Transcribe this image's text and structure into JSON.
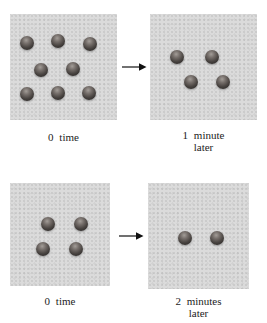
{
  "colors": {
    "background": "#ffffff",
    "box_background": "#dbdbdb",
    "sphere_highlight": "#a39d98",
    "sphere_dark": "#262322",
    "label_text": "#1c1c1c",
    "arrow": "#111111"
  },
  "panels": [
    {
      "name": "top-left",
      "label_lines": [
        "0 time"
      ],
      "sphere_count": 8,
      "spheres": [
        {
          "x": 10,
          "y": 22
        },
        {
          "x": 41,
          "y": 20
        },
        {
          "x": 73,
          "y": 23
        },
        {
          "x": 24,
          "y": 49
        },
        {
          "x": 56,
          "y": 48
        },
        {
          "x": 10,
          "y": 73
        },
        {
          "x": 41,
          "y": 72
        },
        {
          "x": 72,
          "y": 72
        }
      ]
    },
    {
      "name": "top-right",
      "label_lines": [
        "1 minute",
        "later"
      ],
      "sphere_count": 4,
      "spheres": [
        {
          "x": 20,
          "y": 36
        },
        {
          "x": 55,
          "y": 36
        },
        {
          "x": 34,
          "y": 61
        },
        {
          "x": 66,
          "y": 61
        }
      ]
    },
    {
      "name": "bottom-left",
      "label_lines": [
        "0 time"
      ],
      "sphere_count": 4,
      "spheres": [
        {
          "x": 31,
          "y": 34
        },
        {
          "x": 64,
          "y": 34
        },
        {
          "x": 26,
          "y": 59
        },
        {
          "x": 59,
          "y": 59
        }
      ]
    },
    {
      "name": "bottom-right",
      "label_lines": [
        "2 minutes",
        "later"
      ],
      "sphere_count": 2,
      "spheres": [
        {
          "x": 30,
          "y": 48
        },
        {
          "x": 62,
          "y": 48
        }
      ]
    }
  ]
}
